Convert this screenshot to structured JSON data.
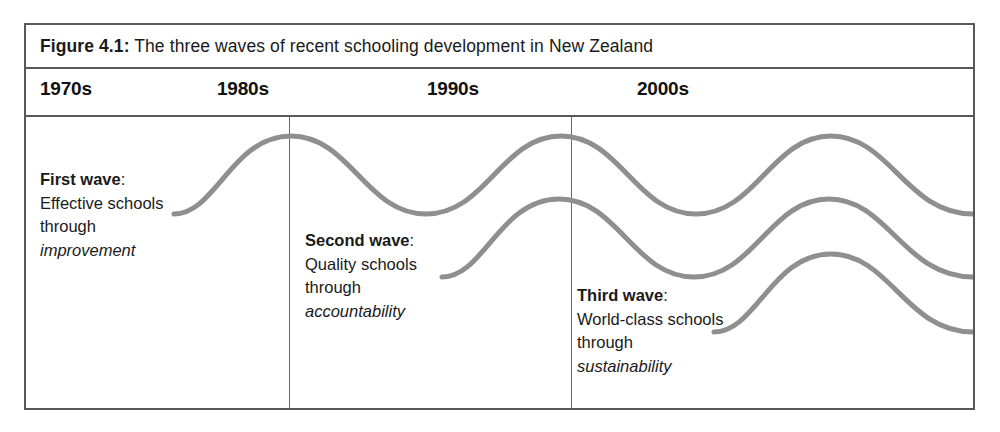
{
  "figure": {
    "label": "Figure 4.1:",
    "caption": "The three waves of recent schooling development in New Zealand",
    "line_color": "#8f8f8f",
    "border_color": "#585858"
  },
  "timeline": {
    "decades": [
      {
        "label": "1970s",
        "x": 14
      },
      {
        "label": "1980s",
        "x": 191
      },
      {
        "label": "1990s",
        "x": 401
      },
      {
        "label": "2000s",
        "x": 611
      }
    ]
  },
  "waves": [
    {
      "heading": "First wave",
      "colon": ":",
      "line2": "Effective schools",
      "line3": "through",
      "line4": "improvement"
    },
    {
      "heading": "Second wave",
      "colon": ":",
      "line2": "Quality schools",
      "line3": "through",
      "line4": "accountability"
    },
    {
      "heading": "Third wave",
      "colon": ":",
      "line2": "World-class schools",
      "line3": "through",
      "line4": "sustainability"
    }
  ],
  "chart_data": {
    "type": "line",
    "title": "The three waves of recent schooling development in New Zealand",
    "xlabel": "",
    "ylabel": "",
    "grid": false,
    "legend": "none",
    "x_tick_labels": [
      "1970s",
      "1980s",
      "1990s",
      "2000s"
    ],
    "annotations": [
      "First wave: Effective schools through improvement",
      "Second wave: Quality schools through accountability",
      "Third wave: World-class schools through sustainability"
    ],
    "series": [
      {
        "name": "First wave",
        "path": "M 148 97 C 190 97 206 19 265 19 C 324 19 340 97 400 97 C 460 97 476 19 535 19 C 594 19 610 97 670 97 C 730 97 746 19 805 19 C 864 19 880 97 947 97"
      },
      {
        "name": "Second wave",
        "path": "M 416 160 C 458 160 474 82 533 82 C 592 82 608 160 668 160 C 728 160 744 82 803 82 C 862 82 878 160 947 160"
      },
      {
        "name": "Third wave",
        "path": "M 688 215 C 730 215 746 137 805 137 C 864 137 880 215 947 215"
      }
    ]
  }
}
